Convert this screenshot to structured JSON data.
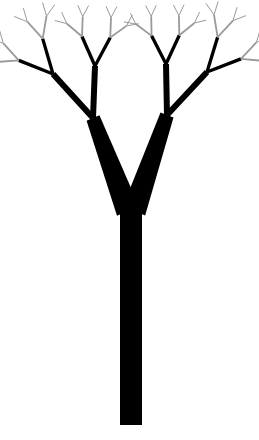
{
  "figure": {
    "background": "#ffffff",
    "ink": "#000000",
    "tip_color": "#9a9a9a"
  },
  "tree": {
    "trunk": {
      "x": 131,
      "base_y": 425,
      "top_y": 205,
      "width": 22
    },
    "fork_point": [
      131,
      205
    ],
    "main_branches": [
      {
        "side": "left",
        "end": [
          93,
          118
        ],
        "width": 14
      },
      {
        "side": "right",
        "end": [
          167,
          115
        ],
        "width": 14
      }
    ],
    "sub_branches": [
      {
        "from": [
          93,
          118
        ],
        "to": [
          53,
          74
        ],
        "width": 6
      },
      {
        "from": [
          93,
          118
        ],
        "to": [
          95,
          66
        ],
        "width": 6
      },
      {
        "from": [
          167,
          115
        ],
        "to": [
          166,
          64
        ],
        "width": 6
      },
      {
        "from": [
          167,
          115
        ],
        "to": [
          207,
          72
        ],
        "width": 6
      }
    ],
    "recursion": {
      "depth": 4,
      "length_ratio": 0.62,
      "width_ratio": 0.55,
      "spread_deg": 26
    },
    "tip_count": 64
  }
}
